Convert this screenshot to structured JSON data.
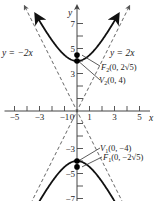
{
  "diagram": {
    "type": "hyperbola",
    "equation": "y^2/16 - x^2/4 = 1",
    "a": 4,
    "b": 2,
    "x_range": [
      -5.8,
      6.5
    ],
    "y_range": [
      -7.2,
      8.4
    ],
    "axes": {
      "x_label": "x",
      "y_label": "y",
      "x_ticks": [
        -5,
        -4,
        -3,
        -2,
        -1,
        1,
        2,
        3,
        4,
        5
      ],
      "x_tick_labels": [
        {
          "value": -5,
          "text": "−5"
        },
        {
          "value": -3,
          "text": "−3"
        },
        {
          "value": -1,
          "text": "−1"
        },
        {
          "value": 0,
          "text": "0"
        },
        {
          "value": 1,
          "text": "1"
        },
        {
          "value": 3,
          "text": "3"
        },
        {
          "value": 5,
          "text": "5"
        }
      ],
      "y_ticks": [
        -7,
        -6,
        -5,
        -4,
        -3,
        -2,
        -1,
        1,
        2,
        3,
        4,
        5,
        6,
        7
      ],
      "y_tick_labels": [
        {
          "value": 7,
          "text": "7"
        },
        {
          "value": 5,
          "text": "5"
        },
        {
          "value": 3,
          "text": "3"
        },
        {
          "value": -3,
          "text": "−3"
        },
        {
          "value": -5,
          "text": "−5"
        },
        {
          "value": -7,
          "text": "−7"
        }
      ]
    },
    "asymptotes": [
      {
        "slope": -2,
        "label": "y = −2x"
      },
      {
        "slope": 2,
        "label": "y = 2x"
      }
    ],
    "points": [
      {
        "name": "F2",
        "x": 0,
        "y": 4.472,
        "label_main": "F",
        "label_sub": "2",
        "label_rest": "(0, 2√5)"
      },
      {
        "name": "V2",
        "x": 0,
        "y": 4,
        "label_main": "V",
        "label_sub": "2",
        "label_rest": "(0, 4)"
      },
      {
        "name": "V1",
        "x": 0,
        "y": -4,
        "label_main": "V",
        "label_sub": "1",
        "label_rest": "(0, −4)"
      },
      {
        "name": "F1",
        "x": 0,
        "y": -4.472,
        "label_main": "F",
        "label_sub": "1",
        "label_rest": "(0, −2√5)"
      }
    ],
    "colors": {
      "curve": "#111111",
      "axis": "#444444",
      "asymptote": "#555555",
      "point": "#000000"
    }
  }
}
